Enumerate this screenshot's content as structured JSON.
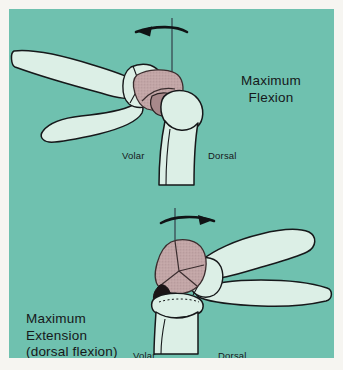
{
  "figure": {
    "title_top": "Maximum\nFlexion",
    "title_bottom": "Maximum\nExtension\n(dorsal flexion)",
    "panel_background": "#6fc1af",
    "bone_fill": "#dcefe6",
    "bone_outline": "#16181a",
    "carpal_shade": "#c2a5a6",
    "axis_line_color": "#2c3340"
  },
  "top_figure": {
    "name": "maximum-flexion-diagram",
    "caption_line1": "Maximum",
    "caption_line2": "Flexion",
    "volar_label": "Volar",
    "dorsal_label": "Dorsal",
    "arrow_direction": "left",
    "arrow_meaning": "palmar flexion rotation"
  },
  "bottom_figure": {
    "name": "maximum-extension-diagram",
    "caption_line1": "Maximum",
    "caption_line2": "Extension",
    "caption_line3": "(dorsal flexion)",
    "volar_label": "Volar",
    "dorsal_label": "Dorsal",
    "arrow_direction": "right",
    "arrow_meaning": "dorsiflexion rotation"
  }
}
